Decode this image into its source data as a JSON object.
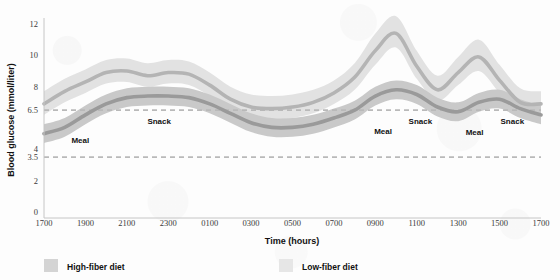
{
  "chart_data": {
    "type": "area",
    "title": "",
    "xlabel": "Time (hours)",
    "ylabel": "Blood glucose (mmol/liter)",
    "x_tick_labels": [
      "1700",
      "1900",
      "2100",
      "2300",
      "0100",
      "0300",
      "0500",
      "0700",
      "0900",
      "1100",
      "1300",
      "1500",
      "1700"
    ],
    "y_tick_labels": [
      "0",
      "2",
      "3.5",
      "4",
      "6.5",
      "8",
      "10",
      "12"
    ],
    "y_tick_values": [
      0,
      2,
      3.5,
      4,
      6.5,
      8,
      10,
      12
    ],
    "ylim": [
      0,
      13
    ],
    "grid": false,
    "legend_position": "bottom",
    "reference_lines": [
      {
        "name": "upper-normal",
        "value": 6.5,
        "style": "dashed",
        "color": "#b9b9b9"
      },
      {
        "name": "lower-normal",
        "value": 3.5,
        "style": "dashed",
        "color": "#b9b9b9"
      }
    ],
    "annotations": [
      {
        "label": "Meal",
        "x_hours": "1730",
        "y": 4.4
      },
      {
        "label": "Snack",
        "x_hours": "2045",
        "y": 5.6
      },
      {
        "label": "Meal",
        "x_hours": "0815",
        "y": 5.0
      },
      {
        "label": "Snack",
        "x_hours": "0945",
        "y": 5.6
      },
      {
        "label": "Meal",
        "x_hours": "1215",
        "y": 4.9
      },
      {
        "label": "Snack",
        "x_hours": "1400",
        "y": 5.6
      }
    ],
    "series": [
      {
        "name": "High-fiber diet",
        "color": "#9a9a9a",
        "band_color": "#c9c9c9",
        "x": [
          "1700",
          "1800",
          "1900",
          "2000",
          "2100",
          "2200",
          "2300",
          "0000",
          "0100",
          "0200",
          "0300",
          "0400",
          "0500",
          "0600",
          "0700",
          "0800",
          "0900",
          "1000",
          "1100",
          "1200",
          "1300",
          "1400",
          "1500",
          "1600",
          "1700"
        ],
        "values": [
          5.0,
          5.4,
          6.2,
          6.9,
          7.3,
          7.4,
          7.4,
          7.3,
          6.9,
          6.3,
          5.7,
          5.4,
          5.4,
          5.6,
          6.0,
          6.5,
          7.4,
          7.8,
          7.5,
          6.7,
          6.4,
          7.0,
          7.2,
          6.6,
          6.2
        ],
        "band_low": [
          4.4,
          4.8,
          5.6,
          6.3,
          6.7,
          6.8,
          6.8,
          6.7,
          6.3,
          5.7,
          5.1,
          4.8,
          4.8,
          5.0,
          5.4,
          5.9,
          6.8,
          7.2,
          6.9,
          6.1,
          5.8,
          6.4,
          6.6,
          6.0,
          5.6
        ],
        "band_high": [
          5.6,
          6.0,
          6.8,
          7.5,
          7.9,
          8.0,
          8.0,
          7.9,
          7.5,
          6.9,
          6.3,
          6.0,
          6.0,
          6.2,
          6.6,
          7.1,
          8.0,
          8.4,
          8.1,
          7.3,
          7.0,
          7.6,
          7.8,
          7.2,
          6.8
        ]
      },
      {
        "name": "Low-fiber diet",
        "color": "#b4b4b4",
        "band_color": "#e2e2e2",
        "x": [
          "1700",
          "1800",
          "1900",
          "2000",
          "2100",
          "2200",
          "2300",
          "0000",
          "0100",
          "0200",
          "0300",
          "0400",
          "0500",
          "0600",
          "0700",
          "0800",
          "0900",
          "1000",
          "1100",
          "1200",
          "1300",
          "1400",
          "1500",
          "1600",
          "1700"
        ],
        "values": [
          6.9,
          7.7,
          8.3,
          8.9,
          9.0,
          8.7,
          8.9,
          8.8,
          8.1,
          7.2,
          6.7,
          6.6,
          6.7,
          7.0,
          7.6,
          8.6,
          10.3,
          11.4,
          9.3,
          7.8,
          8.9,
          9.9,
          8.4,
          7.0,
          6.9
        ],
        "band_low": [
          6.2,
          7.0,
          7.6,
          8.2,
          8.3,
          8.0,
          8.2,
          8.1,
          7.4,
          6.5,
          6.0,
          5.9,
          6.0,
          6.3,
          6.9,
          7.8,
          9.4,
          10.5,
          8.5,
          7.1,
          8.1,
          9.0,
          7.6,
          6.3,
          6.2
        ],
        "band_high": [
          7.7,
          8.5,
          9.1,
          9.7,
          9.8,
          9.5,
          9.7,
          9.6,
          8.9,
          8.0,
          7.5,
          7.4,
          7.5,
          7.8,
          8.4,
          9.5,
          11.4,
          12.5,
          10.3,
          8.7,
          9.9,
          11.0,
          9.4,
          7.9,
          7.7
        ]
      }
    ]
  },
  "legend": {
    "items": [
      {
        "label": "High-fiber diet",
        "swatch": "#d4d4d4"
      },
      {
        "label": "Low-fiber diet",
        "swatch": "#e6e6e6"
      }
    ]
  }
}
